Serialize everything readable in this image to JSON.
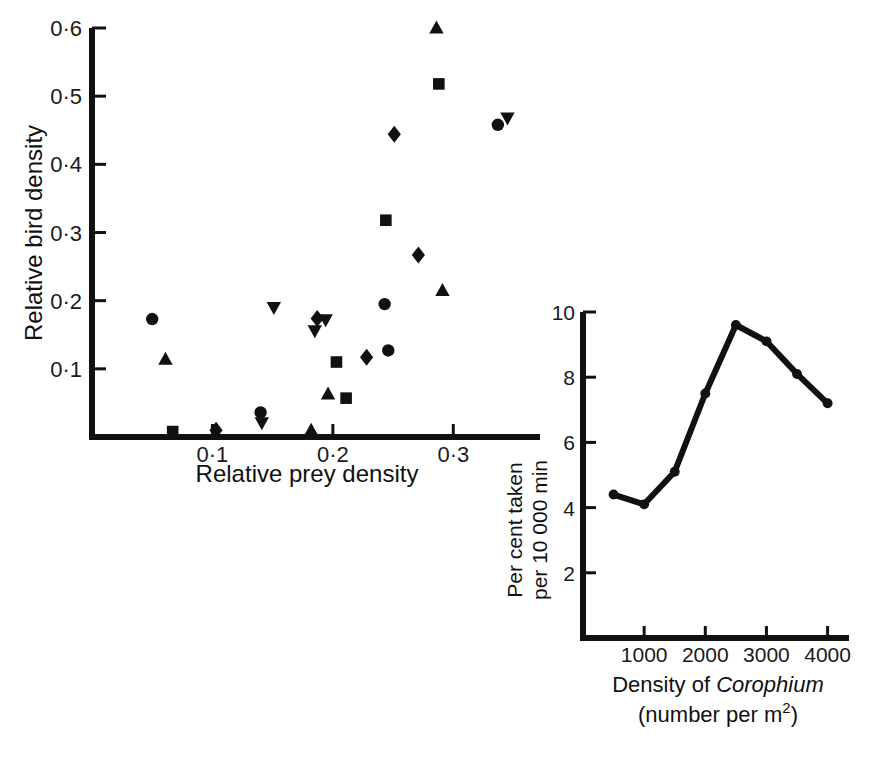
{
  "figure": {
    "background": "#ffffff",
    "ink_color": "#111111"
  },
  "chart_data": [
    {
      "id": "scatter-bird-prey",
      "type": "scatter",
      "title": "",
      "xlabel": "Relative prey density",
      "ylabel": "Relative bird density",
      "xlim": [
        0.0,
        0.372
      ],
      "ylim": [
        0.0,
        0.6
      ],
      "xticks": [
        0.1,
        0.2,
        0.3
      ],
      "xtick_labels": [
        "0·1",
        "0·2",
        "0·3"
      ],
      "yticks": [
        0.1,
        0.2,
        0.3,
        0.4,
        0.5,
        0.6
      ],
      "ytick_labels": [
        "0·1",
        "0·2",
        "0·3",
        "0·4",
        "0·5",
        "0·6"
      ],
      "grid": false,
      "legend": "none",
      "series": [
        {
          "name": "circle",
          "marker": "circle",
          "points": [
            {
              "x": 0.05,
              "y": 0.173
            },
            {
              "x": 0.14,
              "y": 0.036
            },
            {
              "x": 0.243,
              "y": 0.195
            },
            {
              "x": 0.246,
              "y": 0.127
            },
            {
              "x": 0.337,
              "y": 0.458
            }
          ]
        },
        {
          "name": "square",
          "marker": "square",
          "points": [
            {
              "x": 0.067,
              "y": 0.008
            },
            {
              "x": 0.203,
              "y": 0.11
            },
            {
              "x": 0.211,
              "y": 0.057
            },
            {
              "x": 0.244,
              "y": 0.318
            },
            {
              "x": 0.288,
              "y": 0.518
            }
          ]
        },
        {
          "name": "triangle-up",
          "marker": "triangle-up",
          "points": [
            {
              "x": 0.061,
              "y": 0.114
            },
            {
              "x": 0.182,
              "y": 0.01
            },
            {
              "x": 0.196,
              "y": 0.063
            },
            {
              "x": 0.291,
              "y": 0.215
            },
            {
              "x": 0.286,
              "y": 0.6
            }
          ]
        },
        {
          "name": "triangle-down",
          "marker": "triangle-down",
          "points": [
            {
              "x": 0.141,
              "y": 0.021
            },
            {
              "x": 0.151,
              "y": 0.19
            },
            {
              "x": 0.185,
              "y": 0.156
            },
            {
              "x": 0.194,
              "y": 0.172
            },
            {
              "x": 0.345,
              "y": 0.468
            }
          ]
        },
        {
          "name": "diamond",
          "marker": "diamond",
          "points": [
            {
              "x": 0.103,
              "y": 0.01
            },
            {
              "x": 0.187,
              "y": 0.174
            },
            {
              "x": 0.228,
              "y": 0.117
            },
            {
              "x": 0.251,
              "y": 0.444
            },
            {
              "x": 0.271,
              "y": 0.267
            }
          ]
        }
      ]
    },
    {
      "id": "line-corophium",
      "type": "line",
      "title": "",
      "xlabel_main": "Density of ",
      "xlabel_species": "Corophium",
      "xlabel_sub_prefix": "(number per m",
      "xlabel_sub_sup": "2",
      "xlabel_sub_suffix": ")",
      "ylabel_line1": "Per cent taken",
      "ylabel_line2": "per 10 000 min",
      "xlim": [
        0,
        4350
      ],
      "ylim": [
        0,
        10
      ],
      "xticks": [
        1000,
        2000,
        3000,
        4000
      ],
      "xtick_labels": [
        "1000",
        "2000",
        "3000",
        "4000"
      ],
      "yticks": [
        2,
        4,
        6,
        8,
        10
      ],
      "ytick_labels": [
        "2",
        "4",
        "6",
        "8",
        "10"
      ],
      "grid": false,
      "legend": "none",
      "marker": "circle",
      "x": [
        500,
        1000,
        1500,
        2000,
        2500,
        3000,
        3500,
        4000
      ],
      "values": [
        4.4,
        4.1,
        5.1,
        7.5,
        9.6,
        9.1,
        8.1,
        7.2
      ]
    }
  ]
}
